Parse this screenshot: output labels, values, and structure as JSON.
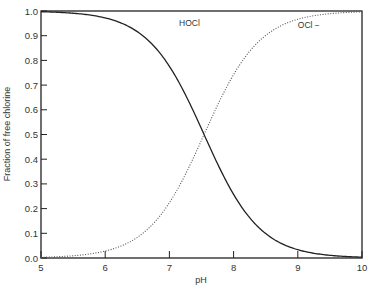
{
  "chart_data": {
    "type": "line",
    "title": "",
    "xlabel": "pH",
    "ylabel": "Fraction of free chlorine",
    "xlim": [
      5,
      10
    ],
    "ylim": [
      0.0,
      1.0
    ],
    "x_ticks": [
      "5",
      "6",
      "7",
      "8",
      "9",
      "10"
    ],
    "y_ticks": [
      "0.0",
      "0.1",
      "0.2",
      "0.3",
      "0.4",
      "0.5",
      "0.6",
      "0.7",
      "0.8",
      "0.9",
      "1.0"
    ],
    "grid": false,
    "legend": "inline labels",
    "x": [
      5.0,
      5.5,
      6.0,
      6.5,
      7.0,
      7.25,
      7.5,
      7.54,
      7.75,
      8.0,
      8.5,
      9.0,
      9.5,
      10.0
    ],
    "series": [
      {
        "name": "HOCl",
        "style": "solid",
        "values": [
          0.997,
          0.991,
          0.972,
          0.916,
          0.776,
          0.661,
          0.523,
          0.5,
          0.381,
          0.258,
          0.099,
          0.034,
          0.011,
          0.003
        ]
      },
      {
        "name": "OCl−",
        "style": "dotted",
        "values": [
          0.003,
          0.009,
          0.028,
          0.084,
          0.224,
          0.339,
          0.477,
          0.5,
          0.619,
          0.742,
          0.901,
          0.966,
          0.989,
          0.997
        ]
      }
    ],
    "annotations": [
      {
        "text": "HOCl",
        "x": 7.15,
        "y": 0.94
      },
      {
        "text": "OCl −",
        "x": 9.0,
        "y": 0.93
      }
    ],
    "pKa": 7.54
  }
}
